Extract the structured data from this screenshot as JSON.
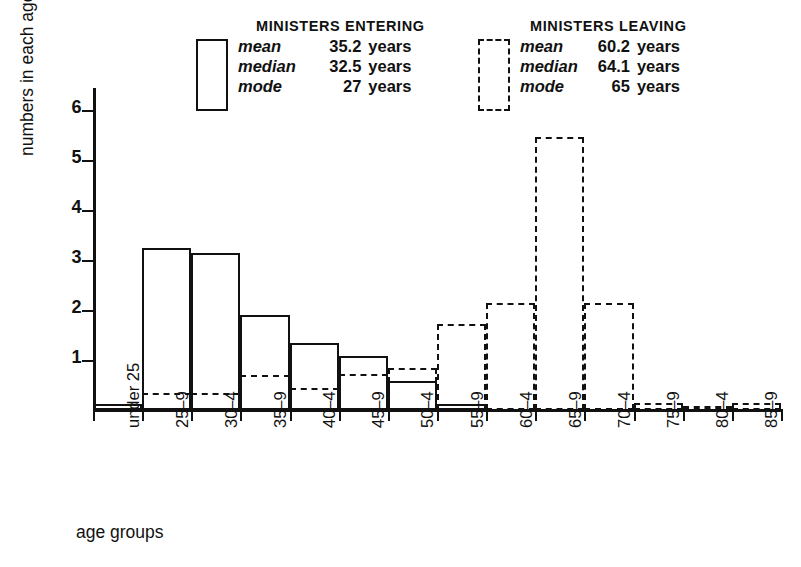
{
  "chart_data": {
    "type": "bar",
    "title": "",
    "xlabel": "age groups",
    "ylabel": "numbers in each age group",
    "ylim": [
      0,
      6.5
    ],
    "yticks": [
      1,
      2,
      3,
      4,
      5,
      6
    ],
    "grid": false,
    "legend_position": "top",
    "categories": [
      "under 25",
      "25–9",
      "30–4",
      "35–9",
      "40–4",
      "45–9",
      "50–4",
      "55–9",
      "60–4",
      "65–9",
      "70–4",
      "75–9",
      "80–4",
      "85–9"
    ],
    "series": [
      {
        "name": "MINISTERS ENTERING",
        "style": "solid",
        "values": [
          0.12,
          3.25,
          3.15,
          1.9,
          1.34,
          1.08,
          0.58,
          0.13,
          0,
          0,
          0,
          0,
          0,
          0
        ]
      },
      {
        "name": "MINISTERS LEAVING",
        "style": "dashed",
        "values": [
          0.05,
          0.35,
          0.35,
          0.7,
          0.45,
          0.72,
          0.85,
          1.72,
          2.15,
          5.46,
          2.15,
          0.15,
          0.08,
          0.15
        ]
      }
    ]
  },
  "legend": {
    "entering": {
      "title": "MINISTERS ENTERING",
      "swatch": "solid-rectangle-outline",
      "stats": [
        {
          "name": "mean",
          "value": "35.2",
          "unit": "years"
        },
        {
          "name": "median",
          "value": "32.5",
          "unit": "years"
        },
        {
          "name": "mode",
          "value": "27",
          "unit": "years"
        }
      ]
    },
    "leaving": {
      "title": "MINISTERS LEAVING",
      "swatch": "dashed-rectangle-outline",
      "stats": [
        {
          "name": "mean",
          "value": "60.2",
          "unit": "years"
        },
        {
          "name": "median",
          "value": "64.1",
          "unit": "years"
        },
        {
          "name": "mode",
          "value": "65",
          "unit": "years"
        }
      ]
    }
  },
  "colors": {
    "ink": "#111111",
    "background": "#ffffff"
  }
}
